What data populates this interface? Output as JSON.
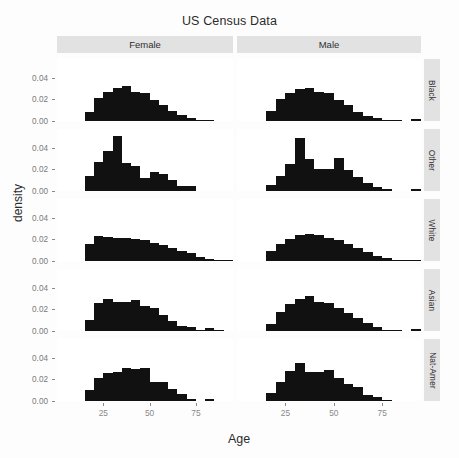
{
  "chart_data": {
    "type": "bar",
    "title": "US Census Data",
    "xlabel": "Age",
    "ylabel": "density",
    "xlim": [
      0,
      95
    ],
    "ylim": [
      0,
      0.05
    ],
    "xticks": [
      25,
      50,
      75
    ],
    "xtick_labels": [
      "25",
      "50",
      "75"
    ],
    "yticks": [
      0.0,
      0.02,
      0.04
    ],
    "ytick_labels": [
      "0.00",
      "0.02",
      "0.04"
    ],
    "grid": false,
    "legend_position": "none",
    "facet_columns": [
      "Female",
      "Male"
    ],
    "facet_rows": [
      "Black",
      "Other",
      "White",
      "Asian",
      "Nat-Amer"
    ],
    "bin_width": 5,
    "bin_starts": [
      15,
      20,
      25,
      30,
      35,
      40,
      45,
      50,
      55,
      60,
      65,
      70,
      75,
      80,
      85,
      90
    ],
    "panels": [
      {
        "row": "Black",
        "column": "Female",
        "values": [
          0.0085,
          0.0215,
          0.0265,
          0.0305,
          0.0325,
          0.027,
          0.0255,
          0.019,
          0.015,
          0.009,
          0.0055,
          0.003,
          0.001,
          0.0004,
          0.0,
          0.0
        ]
      },
      {
        "row": "Black",
        "column": "Male",
        "values": [
          0.009,
          0.02,
          0.0255,
          0.03,
          0.031,
          0.0265,
          0.026,
          0.0195,
          0.0145,
          0.0085,
          0.005,
          0.0025,
          0.0008,
          0.0003,
          0.0,
          0.0015
        ]
      },
      {
        "row": "Other",
        "column": "Female",
        "values": [
          0.014,
          0.027,
          0.0375,
          0.0505,
          0.026,
          0.0235,
          0.0125,
          0.0175,
          0.016,
          0.01,
          0.0045,
          0.0045,
          0.0,
          0.0,
          0.0,
          0.0
        ]
      },
      {
        "row": "Other",
        "column": "Male",
        "values": [
          0.0055,
          0.0135,
          0.025,
          0.049,
          0.03,
          0.02,
          0.02,
          0.031,
          0.019,
          0.013,
          0.0075,
          0.0035,
          0.0015,
          0.0,
          0.0,
          0.0015
        ]
      },
      {
        "row": "White",
        "column": "Female",
        "values": [
          0.0155,
          0.0235,
          0.0225,
          0.0215,
          0.021,
          0.02,
          0.019,
          0.017,
          0.015,
          0.012,
          0.0095,
          0.007,
          0.004,
          0.002,
          0.0008,
          0.0002
        ]
      },
      {
        "row": "White",
        "column": "Male",
        "values": [
          0.009,
          0.0155,
          0.0205,
          0.024,
          0.025,
          0.0245,
          0.0215,
          0.019,
          0.016,
          0.012,
          0.0085,
          0.005,
          0.0025,
          0.001,
          0.0004,
          0.0001
        ]
      },
      {
        "row": "Asian",
        "column": "Female",
        "values": [
          0.0105,
          0.026,
          0.03,
          0.0265,
          0.0265,
          0.0285,
          0.0235,
          0.0215,
          0.015,
          0.009,
          0.005,
          0.0035,
          0.001,
          0.0025,
          0.0005,
          0.0
        ]
      },
      {
        "row": "Asian",
        "column": "Male",
        "values": [
          0.0065,
          0.0175,
          0.025,
          0.03,
          0.0325,
          0.0265,
          0.0255,
          0.0215,
          0.017,
          0.012,
          0.0075,
          0.0035,
          0.001,
          0.0003,
          0.0,
          0.002
        ]
      },
      {
        "row": "Nat-Amer",
        "column": "Female",
        "values": [
          0.0105,
          0.0215,
          0.026,
          0.0265,
          0.0305,
          0.0295,
          0.0305,
          0.018,
          0.0175,
          0.011,
          0.0065,
          0.002,
          0.0,
          0.002,
          0.0,
          0.0
        ]
      },
      {
        "row": "Nat-Amer",
        "column": "Male",
        "values": [
          0.007,
          0.018,
          0.028,
          0.0355,
          0.0265,
          0.027,
          0.029,
          0.0215,
          0.0155,
          0.013,
          0.006,
          0.0035,
          0.0012,
          0.0,
          0.0,
          0.0
        ]
      }
    ]
  },
  "style": {
    "bar_color": "#111111",
    "strip_background": "#e2e2e2",
    "panel_background": "#ffffff",
    "plot_background": "#fdfdfd",
    "axis_text_color": "#7a7a7a"
  }
}
